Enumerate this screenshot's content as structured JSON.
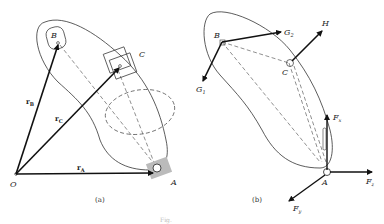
{
  "figure": {
    "panel_a": {
      "caption": "(a)",
      "points": {
        "origin": "O",
        "A": "A",
        "B": "B",
        "C": "C"
      },
      "vectors": [
        {
          "name": "r",
          "sub": "B"
        },
        {
          "name": "r",
          "sub": "C"
        },
        {
          "name": "r",
          "sub": "A"
        }
      ]
    },
    "panel_b": {
      "caption": "(b)",
      "points": {
        "A": "A",
        "B": "B",
        "C": "C"
      },
      "forces": [
        {
          "name": "G",
          "sub": "1"
        },
        {
          "name": "G",
          "sub": "2"
        },
        {
          "name": "H",
          "sub": ""
        },
        {
          "name": "F",
          "sub": "x"
        },
        {
          "name": "F",
          "sub": "y"
        },
        {
          "name": "F",
          "sub": "z"
        }
      ]
    },
    "figure_label": "Fig."
  }
}
